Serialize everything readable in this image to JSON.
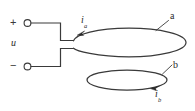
{
  "figure": {
    "type": "electrical-circuit-diagram",
    "background_color": "#ffffff",
    "stroke_color": "#3a3a3a",
    "text_color": "#2b2b2b",
    "width": 195,
    "height": 111
  },
  "source": {
    "voltage_label": "u",
    "positive_terminal_sign": "+",
    "negative_terminal_sign": "−",
    "terminal_marker": "open-circle-terminal"
  },
  "loops": [
    {
      "id": "a",
      "label": "a",
      "current_label": "i",
      "current_subscript": "a",
      "role": "primary-driven-loop",
      "geometry": {
        "cx": 129,
        "cy": 42.5,
        "rx": 57,
        "ry": 14.5
      },
      "current_direction": "counterclockwise-arrow-at-upper-left"
    },
    {
      "id": "b",
      "label": "b",
      "current_label": "i",
      "current_subscript": "b",
      "role": "secondary-induced-loop",
      "geometry": {
        "cx": 127,
        "cy": 80,
        "rx": 40,
        "ry": 10
      },
      "current_direction": "arrow-at-lower-right"
    }
  ],
  "leader_lines": [
    {
      "for": "a",
      "from": [
        168,
        20
      ],
      "to": [
        156,
        30
      ]
    },
    {
      "for": "b",
      "from": [
        172,
        65
      ],
      "to": [
        162,
        74
      ]
    }
  ],
  "wires": {
    "top_path": "from positive terminal right, down, then right to loop a left tip",
    "bottom_path": "from negative terminal right, up, then right to loop a left tip"
  },
  "icons": {
    "plus_terminal": "plus-terminal-icon",
    "minus_terminal": "minus-terminal-icon",
    "arrow_a": "current-arrow-icon",
    "arrow_b": "current-arrow-icon"
  }
}
